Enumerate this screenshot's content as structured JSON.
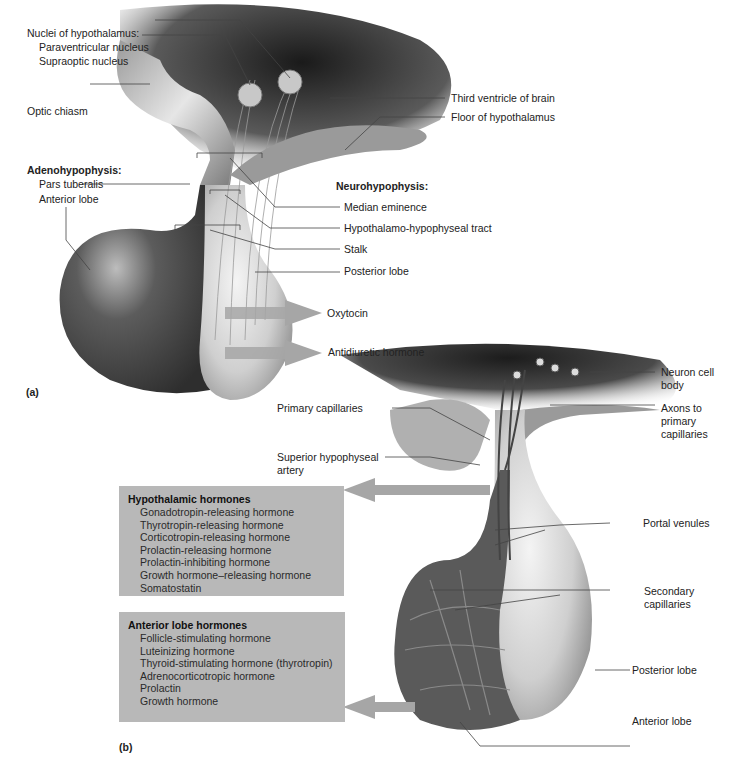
{
  "panel_a": {
    "letter": "(a)",
    "nuclei": {
      "heading": "Nuclei of hypothalamus:",
      "paraventricular": "Paraventricular nucleus",
      "supraoptic": "Supraoptic nucleus"
    },
    "optic_chiasm": "Optic chiasm",
    "third_ventricle": "Third ventricle of brain",
    "floor_hypothalamus": "Floor of hypothalamus",
    "adenohypophysis": {
      "heading": "Adenohypophysis:",
      "pars_tuberalis": "Pars tuberalis",
      "anterior_lobe": "Anterior lobe"
    },
    "neurohypophysis": {
      "heading": "Neurohypophysis:",
      "median_eminence": "Median eminence",
      "tract": "Hypothalamo-hypophyseal tract",
      "stalk": "Stalk",
      "posterior_lobe": "Posterior lobe"
    },
    "outputs": [
      "Oxytocin",
      "Antidiuretic hormone"
    ]
  },
  "panel_b": {
    "letter": "(b)",
    "primary_capillaries": "Primary capillaries",
    "superior_artery": "Superior hypophyseal artery",
    "neuron_cell_body": "Neuron cell body",
    "axons": "Axons to primary capillaries",
    "portal_venules": "Portal venules",
    "secondary_capillaries": "Secondary capillaries",
    "posterior_lobe": "Posterior lobe",
    "anterior_lobe": "Anterior lobe",
    "hypothalamic_box": {
      "title": "Hypothalamic hormones",
      "items": [
        "Gonadotropin-releasing hormone",
        "Thyrotropin-releasing hormone",
        "Corticotropin-releasing hormone",
        "Prolactin-releasing hormone",
        "Prolactin-inhibiting hormone",
        "Growth hormone–releasing hormone",
        "Somatostatin"
      ]
    },
    "anterior_box": {
      "title": "Anterior lobe hormones",
      "items": [
        "Follicle-stimulating hormone",
        "Luteinizing hormone",
        "Thyroid-stimulating hormone (thyrotropin)",
        "Adrenocorticotropic hormone",
        "Prolactin",
        "Growth hormone"
      ]
    }
  },
  "colors": {
    "tissue_dark": "#3a3a3a",
    "tissue_mid": "#8a8a8a",
    "tissue_light": "#e4e4e4",
    "box_fill": "#b8b8b8",
    "arrow": "#a6a6a6",
    "leader": "#444444"
  }
}
